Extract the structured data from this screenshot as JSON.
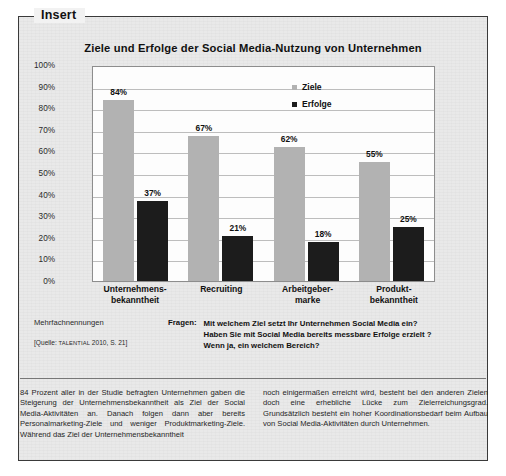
{
  "insert": {
    "legend_label": "Insert"
  },
  "chart_data": {
    "type": "bar",
    "title": "Ziele und Erfolge der Social Media-Nutzung von Unternehmen",
    "xlabel": "",
    "ylabel": "",
    "ylim": [
      0,
      100
    ],
    "yticks": [
      "100%",
      "90%",
      "80%",
      "70%",
      "60%",
      "50%",
      "40%",
      "30%",
      "20%",
      "10%",
      "0%"
    ],
    "ytick_values": [
      100,
      90,
      80,
      70,
      60,
      50,
      40,
      30,
      20,
      10,
      0
    ],
    "grid": true,
    "legend_position": "top-right",
    "categories": [
      "Unternehmens-\nbekanntheit",
      "Recruiting",
      "Arbeitgeber-\nmarke",
      "Produkt-\nbekanntheit"
    ],
    "category_lines": [
      [
        "Unternehmens-",
        "bekanntheit"
      ],
      [
        "Recruiting",
        ""
      ],
      [
        "Arbeitgeber-",
        "marke"
      ],
      [
        "Produkt-",
        "bekanntheit"
      ]
    ],
    "series": [
      {
        "name": "Ziele",
        "color": "#b2b2b2",
        "values": [
          84,
          67,
          62,
          55
        ],
        "labels": [
          "84%",
          "67%",
          "62%",
          "55%"
        ]
      },
      {
        "name": "Erfolge",
        "color": "#1c1c1c",
        "values": [
          37,
          21,
          18,
          25
        ],
        "labels": [
          "37%",
          "21%",
          "18%",
          "25%"
        ]
      }
    ]
  },
  "notes": {
    "multiple_answers": "Mehrfachnennungen",
    "source_prefix": "[Quelle: ",
    "source_name": "TALENTIAL",
    "source_suffix": " 2010, S. 21]"
  },
  "questions": {
    "label": "Fragen:",
    "items": [
      "Mit welchem Ziel setzt Ihr Unternehmen Social Media ein?",
      "Haben Sie mit Social Media bereits messbare Erfolge erzielt ?",
      "Wenn ja, ein welchem Bereich?"
    ]
  },
  "body": {
    "left_column": "84 Prozent aller in der Studie befragten Unternehmen gaben die Steigerung der Unternehmensbekanntheit als Ziel der Social Media-Aktivitäten an. Danach folgen dann aber bereits Personalmarketing-Ziele und weniger Produktmarketing-Ziele. Während das Ziel der Unternehmensbekanntheit",
    "right_column": "noch einigermaßen erreicht wird, besteht bei den anderen Zielen doch eine erhebliche Lücke zum Zielerreichungsgrad. Grundsätzlich besteht ein hoher Koordinationsbedarf beim Aufbau von Social Media-Aktivitäten durch Unternehmen."
  }
}
